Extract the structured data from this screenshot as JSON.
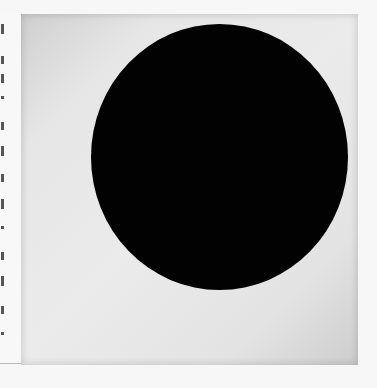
{
  "image": {
    "subject": "black circle painting",
    "description": "Photograph of a square off-white canvas with a large black circle, with a thin cut-off text column at the left edge",
    "colors": {
      "background": "#f7f7f7",
      "canvas": "#e8e8e8",
      "circle": "#020202"
    }
  }
}
